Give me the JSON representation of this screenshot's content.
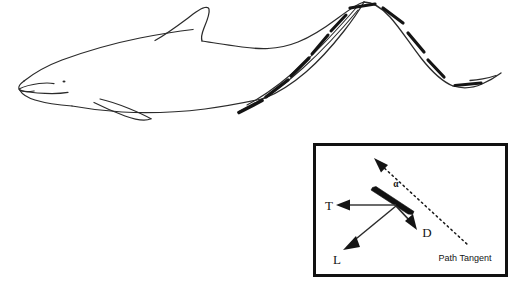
{
  "figure": {
    "name": "dolphin-fluke-hydrodynamics-diagram",
    "background_color": "#ffffff",
    "ink_color": "#1a1a1a",
    "line_color": "#2b2b2b",
    "width": 520,
    "height": 291
  },
  "dolphin": {
    "name": "dolphin-line-drawing",
    "parts": [
      {
        "name": "body-outline",
        "label": ""
      },
      {
        "name": "rostrum-beak",
        "label": ""
      },
      {
        "name": "mouth-line",
        "label": ""
      },
      {
        "name": "eye-dot",
        "label": ""
      },
      {
        "name": "dorsal-fin",
        "label": ""
      },
      {
        "name": "pectoral-flipper",
        "label": ""
      },
      {
        "name": "tail-peduncle",
        "label": ""
      },
      {
        "name": "fluke-stroke-path",
        "label": ""
      }
    ],
    "fluke_segment_count": 9
  },
  "inset": {
    "name": "force-vector-inset",
    "border_color": "#111111",
    "border_width": 3,
    "labels": {
      "thrust": "T",
      "lift": "L",
      "drag": "D",
      "angle_of_attack": "α",
      "path_tangent": "Path Tangent"
    },
    "vectors": [
      {
        "name": "thrust-vector",
        "symbol": "T",
        "direction": "left"
      },
      {
        "name": "lift-vector",
        "symbol": "L",
        "direction": "down-left"
      },
      {
        "name": "drag-vector",
        "symbol": "D",
        "direction": "down-right"
      },
      {
        "name": "path-tangent-line",
        "symbol": "Path Tangent",
        "direction": "up-left-to-down-right",
        "style": "dotted-with-arrowhead"
      }
    ],
    "foil": {
      "name": "fluke-cross-section",
      "style": "thick-tapered-bar"
    }
  }
}
